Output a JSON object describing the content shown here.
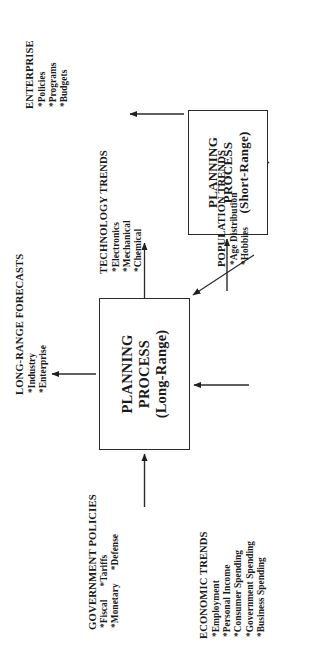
{
  "diagram": {
    "orientation": "rotated-90-ccw",
    "processes": [
      {
        "id": "long-range",
        "line1": "PLANNING",
        "line2": "PROCESS",
        "line3": "(Long-Range)"
      },
      {
        "id": "short-range",
        "line1": "PLANNING",
        "line2": "PROCESS",
        "line3": "(Short-Range)"
      }
    ],
    "inputs": {
      "government_policies": {
        "header": "GOVERNMENT POLICIES",
        "col1": [
          "*Fiscal",
          "*Monetary"
        ],
        "col2": [
          "*Tariffs",
          "*Defense"
        ]
      },
      "economic_trends": {
        "header": "ECONOMIC TRENDS",
        "items": [
          "*Employment",
          "*Personal Income",
          "*Consumer Spending",
          "*Government Spending",
          "*Business Spending"
        ]
      },
      "population_trends": {
        "header": "POPULATION TRENDS",
        "items": [
          "*Age Distribution",
          "*Hobbies"
        ]
      },
      "technology_trends": {
        "header": "TECHNOLOGY TRENDS",
        "items": [
          "*Electronics",
          "*Mechanical",
          "*Chemical"
        ]
      }
    },
    "outputs": {
      "long_range_forecasts": {
        "header": "LONG-RANGE FORECASTS",
        "items": [
          "*Industry",
          "*Enterprise"
        ]
      },
      "enterprise": {
        "header": "ENTERPRISE",
        "items": [
          "*Policies",
          "*Programs",
          "*Budgets"
        ]
      }
    },
    "colors": {
      "ink": "#1a1a1a",
      "line": "#2b2b2b",
      "background": "#ffffff"
    }
  }
}
